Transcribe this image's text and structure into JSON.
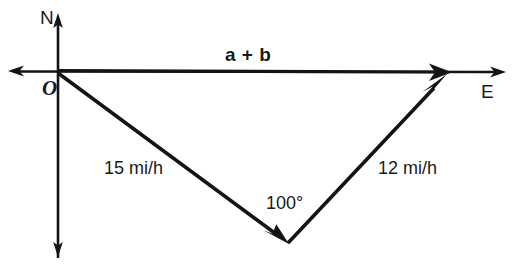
{
  "figure": {
    "type": "vector-diagram",
    "background_color": "#ffffff",
    "stroke_color": "#141414",
    "canvas": {
      "width": 516,
      "height": 265
    }
  },
  "axes": {
    "north_label": "N",
    "east_label": "E",
    "origin_label": "O",
    "origin_point": {
      "x": 58,
      "y": 71
    },
    "north_tip": {
      "x": 58,
      "y": 14
    },
    "south_tip": {
      "x": 58,
      "y": 256
    },
    "east_tip": {
      "x": 506,
      "y": 72
    },
    "west_tip": {
      "x": 8,
      "y": 71
    }
  },
  "vectors": [
    {
      "name": "vector-a",
      "label": "15 mi/h",
      "magnitude": 15,
      "unit": "mi/h",
      "from": {
        "x": 58,
        "y": 73
      },
      "to": {
        "x": 288,
        "y": 243
      },
      "label_position": {
        "x": 106,
        "y": 160
      }
    },
    {
      "name": "vector-b",
      "label": "12 mi/h",
      "magnitude": 12,
      "unit": "mi/h",
      "from": {
        "x": 288,
        "y": 243
      },
      "to": {
        "x": 447,
        "y": 74
      },
      "label_position": {
        "x": 380,
        "y": 160
      }
    },
    {
      "name": "vector-resultant",
      "label": "a + b",
      "from": {
        "x": 58,
        "y": 71
      },
      "to": {
        "x": 452,
        "y": 72
      },
      "label_position": {
        "x": 228,
        "y": 45
      }
    }
  ],
  "annotations": [
    {
      "name": "interior-angle",
      "label": "100°",
      "value": 100,
      "unit": "degrees",
      "at_vertex": {
        "x": 288,
        "y": 243
      },
      "label_position": {
        "x": 268,
        "y": 195
      }
    }
  ]
}
